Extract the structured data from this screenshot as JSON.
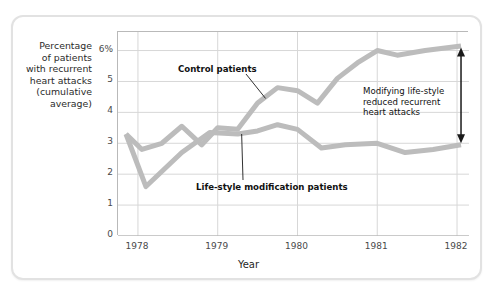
{
  "chart_data": {
    "type": "line",
    "title": "",
    "xlabel": "Year",
    "ylabel": "Percentage of patients with recurrent heart attacks (cumulative average)",
    "xlim": [
      1977.75,
      1982.15
    ],
    "ylim": [
      0,
      6.6
    ],
    "yticks": [
      0,
      1,
      2,
      3,
      4,
      5,
      6
    ],
    "ytick_labels": [
      "0",
      "1",
      "2",
      "3",
      "4",
      "5",
      "6%"
    ],
    "xticks": [
      1978,
      1979,
      1980,
      1981,
      1982
    ],
    "xtick_labels": [
      "1978",
      "1979",
      "1980",
      "1981",
      "1982"
    ],
    "x_minor_interval": 0.25,
    "grid": "both",
    "legend": "inline-annotations",
    "line_color": "#bcbcbc",
    "line_width": 5,
    "series": [
      {
        "name": "Control patients",
        "x": [
          1977.85,
          1978.05,
          1978.3,
          1978.55,
          1978.8,
          1979.0,
          1979.25,
          1979.5,
          1979.75,
          1980.0,
          1980.25,
          1980.5,
          1980.75,
          1981.0,
          1981.25,
          1981.6,
          1982.05
        ],
        "values": [
          3.3,
          2.8,
          3.0,
          3.55,
          2.95,
          3.5,
          3.45,
          4.3,
          4.8,
          4.7,
          4.3,
          5.1,
          5.6,
          6.0,
          5.85,
          6.0,
          6.15
        ]
      },
      {
        "name": "Life-style modification patients",
        "x": [
          1977.85,
          1978.1,
          1978.55,
          1978.9,
          1979.25,
          1979.5,
          1979.75,
          1980.0,
          1980.3,
          1980.6,
          1981.0,
          1981.35,
          1981.7,
          1982.05
        ],
        "values": [
          3.3,
          1.6,
          2.7,
          3.35,
          3.3,
          3.4,
          3.6,
          3.45,
          2.85,
          2.95,
          3.0,
          2.7,
          2.8,
          2.95
        ]
      }
    ],
    "annotations": [
      {
        "name": "control-patients-label",
        "text": "Control patients",
        "type": "leader-line",
        "points_to": [
          1979.6,
          4.45
        ]
      },
      {
        "name": "life-style-modification-label",
        "text": "Life-style modification patients",
        "type": "leader-line",
        "points_to": [
          1979.3,
          3.3
        ]
      },
      {
        "name": "gap-callout",
        "text": "Modifying life-style reduced recurrent heart attacks",
        "type": "double-arrow",
        "arrow_span": [
          3.0,
          6.1
        ],
        "arrow_x": 1982.05
      }
    ]
  },
  "axis": {
    "y_title_lines": [
      "Percentage",
      "of patients",
      "with recurrent",
      "heart attacks",
      "(cumulative",
      "average)"
    ],
    "x_title": "Year"
  },
  "colors": {
    "line": "#bcbcbc",
    "grid": "#d7d7d7",
    "axis": "#b9b9b9",
    "text": "#1f1f1f",
    "tick_text": "#4a4a4a",
    "card_border": "#e2e2e2",
    "arrow": "#1a1a1a"
  }
}
